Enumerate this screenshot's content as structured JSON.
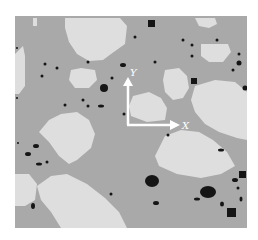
{
  "figure": {
    "type": "microstructure-micrograph",
    "colors": {
      "matrix": "#a9a9a9",
      "grain": "#dedede",
      "particle": "#151515",
      "axis": "#ffffff",
      "background": "#ffffff"
    },
    "axes": {
      "x_label": "X",
      "y_label": "Y"
    }
  }
}
